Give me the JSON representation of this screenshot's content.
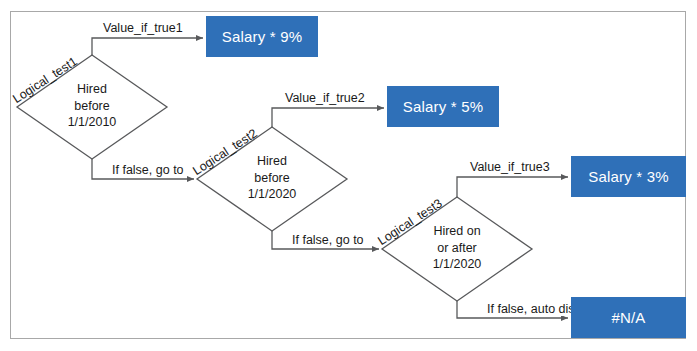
{
  "diagram": {
    "accent_color": "#2f70b8",
    "frame_color": "#a8a8a8",
    "text_color": "#1a1a1a",
    "decisions": [
      {
        "id": "decision-1",
        "test_label": "Logical_test1",
        "line1": "Hired",
        "line2": "before",
        "line3": "1/1/2010",
        "true_label": "Value_if_true1",
        "false_label": "If false, go to"
      },
      {
        "id": "decision-2",
        "test_label": "Logical_test2",
        "line1": "Hired",
        "line2": "before",
        "line3": "1/1/2020",
        "true_label": "Value_if_true2",
        "false_label": "If false, go to"
      },
      {
        "id": "decision-3",
        "test_label": "Logical_test3",
        "line1": "Hired on",
        "line2": "or after",
        "line3": "1/1/2020",
        "true_label": "Value_if_true3",
        "false_label": "If false, auto display"
      }
    ],
    "results": [
      {
        "id": "result-1",
        "text": "Salary * 9%"
      },
      {
        "id": "result-2",
        "text": "Salary * 5%"
      },
      {
        "id": "result-3",
        "text": "Salary * 3%"
      },
      {
        "id": "result-na",
        "text": "#N/A"
      }
    ]
  }
}
